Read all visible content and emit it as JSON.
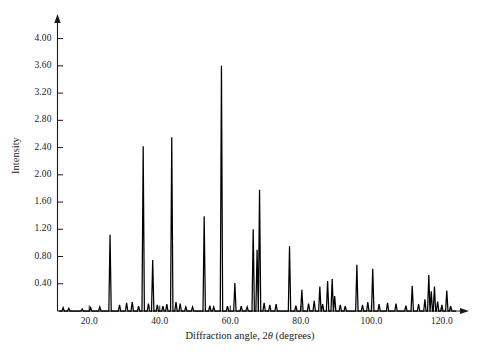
{
  "chart_data": {
    "type": "line",
    "title": "",
    "xlabel": "Diffraction angle, 2θ (degrees)",
    "xlabel_pre": "Diffraction angle, 2",
    "xlabel_theta": "θ",
    "xlabel_post": " (degrees)",
    "ylabel": "Intensity",
    "xlim": [
      11.0,
      126.0
    ],
    "ylim": [
      0.0,
      4.2
    ],
    "grid": false,
    "legend": null,
    "xticks": [
      20.0,
      40.0,
      60.0,
      80.0,
      100.0,
      120.0
    ],
    "xtick_labels": [
      "20.0",
      "40.0",
      "60.0",
      "80.0",
      "100.0",
      "120.0"
    ],
    "yticks": [
      0.4,
      0.8,
      1.2,
      1.6,
      2.0,
      2.4,
      2.8,
      3.2,
      3.6,
      4.0
    ],
    "ytick_labels": [
      "0.40",
      "0.80",
      "1.20",
      "1.60",
      "2.00",
      "2.40",
      "2.80",
      "3.20",
      "3.60",
      "4.00"
    ],
    "series_name": "diffraction-pattern",
    "line_color": "#000000",
    "axis_color": "#1a1a1a",
    "peaks": [
      {
        "x": 12.6,
        "y": 0.05
      },
      {
        "x": 14.2,
        "y": 0.04
      },
      {
        "x": 18.0,
        "y": 0.03
      },
      {
        "x": 20.4,
        "y": 0.05
      },
      {
        "x": 23.0,
        "y": 0.06
      },
      {
        "x": 25.9,
        "y": 1.12
      },
      {
        "x": 28.6,
        "y": 0.09
      },
      {
        "x": 30.6,
        "y": 0.12
      },
      {
        "x": 32.2,
        "y": 0.13
      },
      {
        "x": 34.0,
        "y": 0.07
      },
      {
        "x": 35.3,
        "y": 2.42
      },
      {
        "x": 36.8,
        "y": 0.11
      },
      {
        "x": 38.0,
        "y": 0.75
      },
      {
        "x": 39.3,
        "y": 0.09
      },
      {
        "x": 40.9,
        "y": 0.07
      },
      {
        "x": 42.0,
        "y": 0.1
      },
      {
        "x": 43.4,
        "y": 2.55
      },
      {
        "x": 44.6,
        "y": 0.13
      },
      {
        "x": 45.8,
        "y": 0.11
      },
      {
        "x": 47.4,
        "y": 0.06
      },
      {
        "x": 49.3,
        "y": 0.06
      },
      {
        "x": 52.6,
        "y": 1.39
      },
      {
        "x": 54.2,
        "y": 0.08
      },
      {
        "x": 55.3,
        "y": 0.06
      },
      {
        "x": 57.5,
        "y": 3.6
      },
      {
        "x": 59.2,
        "y": 0.07
      },
      {
        "x": 61.3,
        "y": 0.41
      },
      {
        "x": 63.1,
        "y": 0.07
      },
      {
        "x": 64.8,
        "y": 0.06
      },
      {
        "x": 66.5,
        "y": 1.2
      },
      {
        "x": 67.6,
        "y": 0.9
      },
      {
        "x": 68.3,
        "y": 1.78
      },
      {
        "x": 69.6,
        "y": 0.12
      },
      {
        "x": 71.2,
        "y": 0.09
      },
      {
        "x": 73.0,
        "y": 0.1
      },
      {
        "x": 76.8,
        "y": 0.95
      },
      {
        "x": 78.6,
        "y": 0.08
      },
      {
        "x": 80.3,
        "y": 0.31
      },
      {
        "x": 82.2,
        "y": 0.11
      },
      {
        "x": 83.8,
        "y": 0.15
      },
      {
        "x": 85.4,
        "y": 0.36
      },
      {
        "x": 86.2,
        "y": 0.1
      },
      {
        "x": 87.6,
        "y": 0.44
      },
      {
        "x": 88.9,
        "y": 0.47
      },
      {
        "x": 89.6,
        "y": 0.22
      },
      {
        "x": 91.2,
        "y": 0.09
      },
      {
        "x": 92.6,
        "y": 0.07
      },
      {
        "x": 95.9,
        "y": 0.68
      },
      {
        "x": 97.5,
        "y": 0.09
      },
      {
        "x": 99.0,
        "y": 0.13
      },
      {
        "x": 100.4,
        "y": 0.62
      },
      {
        "x": 102.2,
        "y": 0.1
      },
      {
        "x": 104.6,
        "y": 0.12
      },
      {
        "x": 107.0,
        "y": 0.11
      },
      {
        "x": 109.8,
        "y": 0.08
      },
      {
        "x": 111.6,
        "y": 0.37
      },
      {
        "x": 113.4,
        "y": 0.1
      },
      {
        "x": 115.2,
        "y": 0.17
      },
      {
        "x": 116.3,
        "y": 0.53
      },
      {
        "x": 117.0,
        "y": 0.29
      },
      {
        "x": 117.9,
        "y": 0.36
      },
      {
        "x": 118.8,
        "y": 0.14
      },
      {
        "x": 120.0,
        "y": 0.09
      },
      {
        "x": 121.4,
        "y": 0.3
      },
      {
        "x": 122.5,
        "y": 0.07
      }
    ]
  }
}
